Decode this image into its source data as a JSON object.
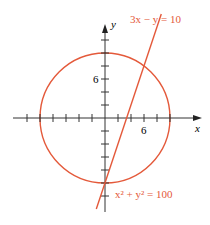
{
  "diagram": {
    "type": "coordinate-plane",
    "axes": {
      "x_label": "x",
      "y_label": "y",
      "x_tick_label": "6",
      "y_tick_label": "6",
      "tick_spacing_units": 2,
      "x_range": [
        -12,
        14
      ],
      "y_range": [
        -12,
        14
      ]
    },
    "curves": [
      {
        "kind": "circle",
        "equation": "x² + y² = 100",
        "center": [
          0,
          0
        ],
        "radius": 10,
        "color": "#e4593a"
      },
      {
        "kind": "line",
        "equation": "3x − y = 10",
        "slope": 3,
        "intercept": -10,
        "color": "#e4593a"
      }
    ],
    "intersections": [
      [
        0,
        -10
      ],
      [
        6,
        8
      ]
    ],
    "colors": {
      "curve": "#e4593a",
      "axis": "#333333",
      "text": "#222222"
    }
  },
  "labels": {
    "line_equation": "3x − y = 10",
    "circle_equation_base": "x",
    "circle_equation": "x² + y² = 100",
    "x_axis": "x",
    "y_axis": "y",
    "x_tick_6": "6",
    "y_tick_6": "6"
  }
}
